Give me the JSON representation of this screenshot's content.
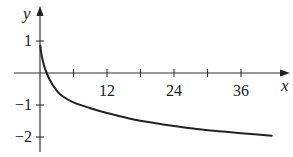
{
  "chart_data": {
    "type": "line",
    "title": "",
    "xlabel": "x",
    "ylabel": "y",
    "xlim": [
      0,
      43
    ],
    "ylim": [
      -2.3,
      1.6
    ],
    "grid": false,
    "legend": null,
    "x_ticks": [
      6,
      12,
      18,
      24,
      30,
      36
    ],
    "x_tick_labels": [
      {
        "value": 12,
        "label": "12"
      },
      {
        "value": 24,
        "label": "24"
      },
      {
        "value": 36,
        "label": "36"
      }
    ],
    "y_ticks": [
      1,
      -1,
      -2
    ],
    "y_tick_labels": [
      {
        "value": 1,
        "label": "1"
      },
      {
        "value": -1,
        "label": "−1"
      },
      {
        "value": -2,
        "label": "−2"
      }
    ],
    "series": [
      {
        "name": "curve",
        "color": "#222222",
        "x": [
          0.05,
          0.3,
          0.7,
          1.2,
          2,
          3,
          4,
          6,
          9,
          12,
          16,
          20,
          24,
          28,
          32,
          36,
          41.5
        ],
        "y": [
          0.85,
          0.55,
          0.25,
          0.0,
          -0.3,
          -0.55,
          -0.72,
          -0.92,
          -1.1,
          -1.25,
          -1.42,
          -1.55,
          -1.66,
          -1.75,
          -1.82,
          -1.88,
          -1.96
        ]
      }
    ]
  },
  "axes": {
    "x_label": "x",
    "y_label": "y"
  }
}
